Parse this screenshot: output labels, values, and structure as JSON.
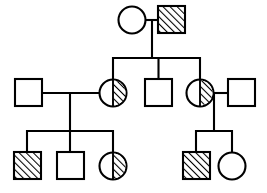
{
  "diagram": {
    "type": "pedigree",
    "legend": {
      "square": "male",
      "circle": "female",
      "full-hatch": "affected",
      "half-hatch": "carrier",
      "empty": "unaffected"
    },
    "stroke_color": "#000000",
    "background_color": "#ffffff",
    "generations": [
      {
        "id": "I",
        "label": "generation-1",
        "individuals": [
          {
            "id": "I-1",
            "name": "generation1-female-unaffected",
            "sex": "female",
            "shape": "circle",
            "status": "unaffected",
            "fill": "empty",
            "cx": 132,
            "cy": 20,
            "r": 13.5
          },
          {
            "id": "I-2",
            "name": "generation1-male-affected",
            "sex": "male",
            "shape": "square",
            "status": "affected",
            "fill": "full-hatch",
            "x": 158,
            "y": 6,
            "size": 27
          }
        ]
      },
      {
        "id": "II",
        "label": "generation-2",
        "individuals": [
          {
            "id": "II-1",
            "name": "generation2-male-spouse-left",
            "sex": "male",
            "shape": "square",
            "status": "unaffected",
            "fill": "empty",
            "x": 15,
            "y": 79,
            "size": 27
          },
          {
            "id": "II-2",
            "name": "generation2-female-carrier-left",
            "sex": "female",
            "shape": "circle",
            "status": "carrier",
            "fill": "half-hatch",
            "cx": 113,
            "cy": 93,
            "r": 13.5
          },
          {
            "id": "II-3",
            "name": "generation2-male-unaffected-middle",
            "sex": "male",
            "shape": "square",
            "status": "unaffected",
            "fill": "empty",
            "x": 145,
            "y": 79,
            "size": 27
          },
          {
            "id": "II-4",
            "name": "generation2-female-carrier-right",
            "sex": "female",
            "shape": "circle",
            "status": "carrier",
            "fill": "half-hatch",
            "cx": 200,
            "cy": 93,
            "r": 13.5
          },
          {
            "id": "II-5",
            "name": "generation2-male-spouse-right",
            "sex": "male",
            "shape": "square",
            "status": "unaffected",
            "fill": "empty",
            "x": 228,
            "y": 79,
            "size": 27
          }
        ]
      },
      {
        "id": "III",
        "label": "generation-3",
        "individuals": [
          {
            "id": "III-1",
            "name": "generation3-male-affected-left",
            "sex": "male",
            "shape": "square",
            "status": "affected",
            "fill": "full-hatch",
            "x": 14,
            "y": 152,
            "size": 27
          },
          {
            "id": "III-2",
            "name": "generation3-male-unaffected",
            "sex": "male",
            "shape": "square",
            "status": "unaffected",
            "fill": "empty",
            "x": 57,
            "y": 152,
            "size": 27
          },
          {
            "id": "III-3",
            "name": "generation3-female-carrier",
            "sex": "female",
            "shape": "circle",
            "status": "carrier",
            "fill": "half-hatch",
            "cx": 113,
            "cy": 166,
            "r": 13.5
          },
          {
            "id": "III-4",
            "name": "generation3-male-affected-right",
            "sex": "male",
            "shape": "square",
            "status": "affected",
            "fill": "full-hatch",
            "x": 183,
            "y": 152,
            "size": 27
          },
          {
            "id": "III-5",
            "name": "generation3-female-unaffected",
            "sex": "female",
            "shape": "circle",
            "status": "unaffected",
            "fill": "empty",
            "cx": 232,
            "cy": 166,
            "r": 13.5
          }
        ]
      }
    ],
    "connections": [
      {
        "id": "mating-1",
        "name": "mating-line-generation1",
        "type": "mating",
        "x1": 145.5,
        "y1": 20,
        "x2": 158,
        "y2": 20
      },
      {
        "id": "drop-1",
        "name": "descent-line-generation1",
        "type": "descent",
        "x1": 152,
        "y1": 20,
        "x2": 152,
        "y2": 58
      },
      {
        "id": "sib-1",
        "name": "sibship-line-generation2",
        "type": "sibship",
        "x1": 113,
        "y1": 58,
        "x2": 200,
        "y2": 58
      },
      {
        "id": "stem-2a",
        "name": "sibling-stem-generation2-left",
        "type": "stem",
        "x1": 113,
        "y1": 58,
        "x2": 113,
        "y2": 79.5
      },
      {
        "id": "stem-2b",
        "name": "sibling-stem-generation2-middle",
        "type": "stem",
        "x1": 158.5,
        "y1": 58,
        "x2": 158.5,
        "y2": 79
      },
      {
        "id": "stem-2c",
        "name": "sibling-stem-generation2-right",
        "type": "stem",
        "x1": 200,
        "y1": 58,
        "x2": 200,
        "y2": 79.5
      },
      {
        "id": "mating-2",
        "name": "mating-line-generation2-left",
        "type": "mating",
        "x1": 42,
        "y1": 93,
        "x2": 99.5,
        "y2": 93
      },
      {
        "id": "drop-2",
        "name": "descent-line-generation2-left",
        "type": "descent",
        "x1": 70,
        "y1": 93,
        "x2": 70,
        "y2": 131
      },
      {
        "id": "mating-3",
        "name": "mating-line-generation2-right",
        "type": "mating",
        "x1": 213.5,
        "y1": 93,
        "x2": 228,
        "y2": 93
      },
      {
        "id": "drop-3",
        "name": "descent-line-generation2-right",
        "type": "descent",
        "x1": 214,
        "y1": 93,
        "x2": 214,
        "y2": 131
      },
      {
        "id": "sib-2",
        "name": "sibship-line-generation3-left",
        "type": "sibship",
        "x1": 27,
        "y1": 131,
        "x2": 113,
        "y2": 131
      },
      {
        "id": "stem-3a",
        "name": "sibling-stem-generation3-first",
        "type": "stem",
        "x1": 27,
        "y1": 131,
        "x2": 27,
        "y2": 152
      },
      {
        "id": "stem-3b",
        "name": "sibling-stem-generation3-second",
        "type": "stem",
        "x1": 70,
        "y1": 131,
        "x2": 70,
        "y2": 152
      },
      {
        "id": "stem-3c",
        "name": "sibling-stem-generation3-third",
        "type": "stem",
        "x1": 113,
        "y1": 131,
        "x2": 113,
        "y2": 152.5
      },
      {
        "id": "sib-3",
        "name": "sibship-line-generation3-right",
        "type": "sibship",
        "x1": 196,
        "y1": 131,
        "x2": 232,
        "y2": 131
      },
      {
        "id": "stem-3d",
        "name": "sibling-stem-generation3-fourth",
        "type": "stem",
        "x1": 196,
        "y1": 131,
        "x2": 196,
        "y2": 152
      },
      {
        "id": "stem-3e",
        "name": "sibling-stem-generation3-fifth",
        "type": "stem",
        "x1": 232,
        "y1": 131,
        "x2": 232,
        "y2": 152.5
      }
    ]
  }
}
